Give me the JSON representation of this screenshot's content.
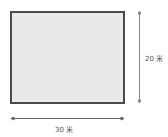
{
  "diagram": {
    "shape": "rectangle",
    "fill_color": "#e9e9e9",
    "border_color": "#4a4a4a",
    "height_label": "20 米",
    "width_label": "30 米"
  }
}
